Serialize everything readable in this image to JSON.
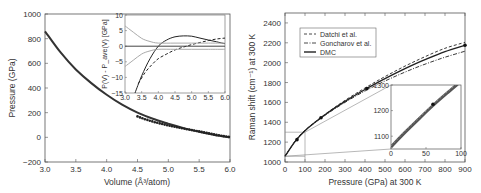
{
  "chart_data": [
    {
      "type": "line",
      "title": "",
      "xlabel": "Volume (Å³/atom)",
      "ylabel": "Pressure (GPa)",
      "xlim": [
        3.0,
        6.0
      ],
      "ylim": [
        -200,
        1000
      ],
      "xticks": [
        "3.0",
        "3.5",
        "4.0",
        "4.5",
        "5.0",
        "5.5",
        "6.0"
      ],
      "yticks": [
        "-200",
        "0",
        "200",
        "400",
        "600",
        "800",
        "1000"
      ],
      "series": [
        {
          "name": "equation of state curve",
          "x": [
            3.0,
            3.25,
            3.5,
            3.75,
            4.0,
            4.25,
            4.5,
            4.75,
            5.0,
            5.25,
            5.5,
            5.75,
            6.0
          ],
          "y": [
            860,
            690,
            550,
            440,
            345,
            265,
            200,
            150,
            110,
            75,
            45,
            20,
            0
          ]
        },
        {
          "name": "data points",
          "x": [
            4.5,
            4.6,
            4.7,
            4.8,
            4.9,
            5.0,
            5.1,
            5.2,
            5.3,
            5.4,
            5.5,
            5.6,
            5.7,
            5.8,
            5.9,
            6.0
          ],
          "y": [
            170,
            150,
            135,
            120,
            108,
            96,
            86,
            76,
            66,
            57,
            48,
            38,
            28,
            18,
            10,
            2
          ]
        }
      ],
      "inset": {
        "ylabel": "P(V) - P_ave(V) [GPa]",
        "xlim": [
          3.0,
          6.0
        ],
        "ylim": [
          -15,
          10
        ],
        "xticks": [
          "3.0",
          "3.5",
          "4.0",
          "4.5",
          "5.0",
          "5.5",
          "6.0"
        ],
        "yticks": [
          "-15",
          "-10",
          "-5",
          "0",
          "5",
          "10"
        ],
        "series": [
          {
            "name": "solid dark",
            "x": [
              3.3,
              3.5,
              3.75,
              4.0,
              4.25,
              4.5,
              4.75,
              5.0,
              5.25,
              5.5,
              5.75,
              6.0
            ],
            "y": [
              -15,
              -9.5,
              -4,
              0,
              2.0,
              3.0,
              3.3,
              3.2,
              2.6,
              2.0,
              1.4,
              0.8
            ]
          },
          {
            "name": "dashed",
            "x": [
              3.4,
              3.6,
              3.8,
              4.0,
              4.25,
              4.5,
              4.75,
              5.0,
              5.25,
              5.5,
              5.75,
              6.0
            ],
            "y": [
              -12,
              -8.5,
              -6,
              -4,
              -2.5,
              -1.2,
              -0.3,
              0.5,
              1.2,
              1.8,
              2.3,
              2.6
            ]
          },
          {
            "name": "upper grey band",
            "x": [
              3.0,
              3.25,
              3.5,
              3.75,
              4.0,
              4.5,
              5.0,
              5.5,
              6.0
            ],
            "y": [
              6.5,
              4.5,
              2.5,
              1.5,
              1.0,
              1.0,
              1.0,
              1.0,
              1.0
            ]
          },
          {
            "name": "lower grey band",
            "x": [
              3.0,
              3.25,
              3.5,
              3.75,
              4.0,
              4.5,
              5.0,
              5.5,
              6.0
            ],
            "y": [
              -6.5,
              -4.5,
              -2.5,
              -1.5,
              -1.0,
              -1.0,
              -1.0,
              -1.0,
              -1.0
            ]
          },
          {
            "name": "zero line",
            "x": [
              3.0,
              6.0
            ],
            "y": [
              0,
              0
            ]
          }
        ]
      }
    },
    {
      "type": "line",
      "title": "",
      "xlabel": "Pressure (GPa) at 300 K",
      "ylabel": "Raman shift (cm⁻¹) at 300 K",
      "xlim": [
        0,
        900
      ],
      "ylim": [
        1000,
        2500
      ],
      "xticks": [
        "0",
        "100",
        "200",
        "300",
        "400",
        "500",
        "600",
        "700",
        "800",
        "900"
      ],
      "yticks": [
        "1000",
        "1200",
        "1400",
        "1600",
        "1800",
        "2000",
        "2200",
        "2400"
      ],
      "legend": [
        "Datchi et al.",
        "Goncharov et al.",
        "DMC"
      ],
      "legend_position": "upper left",
      "series": [
        {
          "name": "Datchi et al.",
          "style": "dashed",
          "x": [
            0,
            50,
            100,
            200,
            300,
            400,
            500,
            600,
            700,
            800,
            900
          ],
          "y": [
            1058,
            1210,
            1320,
            1480,
            1620,
            1745,
            1860,
            1965,
            2060,
            2145,
            2205
          ]
        },
        {
          "name": "Goncharov et al.",
          "style": "dash-dot",
          "x": [
            0,
            50,
            100,
            200,
            300,
            400,
            500,
            600,
            700,
            800,
            900
          ],
          "y": [
            1058,
            1205,
            1315,
            1470,
            1600,
            1715,
            1815,
            1905,
            1985,
            2055,
            2115
          ]
        },
        {
          "name": "DMC",
          "style": "solid",
          "x": [
            0,
            50,
            100,
            200,
            300,
            400,
            500,
            600,
            700,
            800,
            900
          ],
          "y": [
            1058,
            1205,
            1315,
            1475,
            1610,
            1730,
            1840,
            1940,
            2030,
            2110,
            2175
          ]
        },
        {
          "name": "DMC points",
          "style": "markers",
          "x": [
            60,
            180,
            410,
            900
          ],
          "y": [
            1225,
            1445,
            1740,
            2175
          ]
        }
      ],
      "inset": {
        "xlim": [
          0,
          100
        ],
        "ylim": [
          1050,
          1300
        ],
        "xticks": [
          "0",
          "50",
          "100"
        ],
        "yticks": [
          "1100",
          "1200",
          "1300"
        ],
        "zoom_box": {
          "x": [
            0,
            100
          ],
          "y": [
            1058,
            1300
          ]
        }
      }
    }
  ]
}
